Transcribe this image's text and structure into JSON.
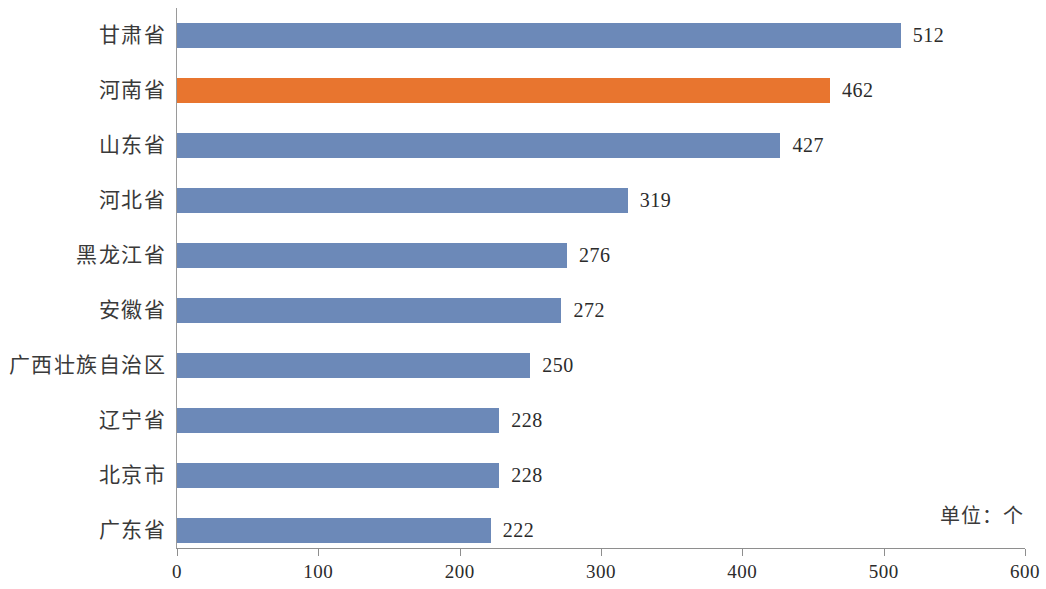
{
  "chart_data": {
    "type": "bar",
    "orientation": "horizontal",
    "title": "",
    "xlabel": "",
    "ylabel": "",
    "unit_note": "单位：个",
    "xlim": [
      0,
      600
    ],
    "xticks": [
      0,
      100,
      200,
      300,
      400,
      500,
      600
    ],
    "xtick_labels": [
      "0",
      "100",
      "200",
      "300",
      "400",
      "500",
      "600"
    ],
    "grid": false,
    "legend": false,
    "categories": [
      "甘肃省",
      "河南省",
      "山东省",
      "河北省",
      "黑龙江省",
      "安徽省",
      "广西壮族自治区",
      "辽宁省",
      "北京市",
      "广东省"
    ],
    "values": [
      512,
      462,
      427,
      319,
      276,
      272,
      250,
      228,
      228,
      222
    ],
    "value_labels": [
      "512",
      "462",
      "427",
      "319",
      "276",
      "272",
      "250",
      "228",
      "228",
      "222"
    ],
    "highlight_index": 1,
    "colors": {
      "bar": "#6c89b8",
      "bar_highlight": "#e8752f",
      "axis": "#8e8e8e",
      "text": "#2b2b2b",
      "background": "#ffffff"
    }
  }
}
